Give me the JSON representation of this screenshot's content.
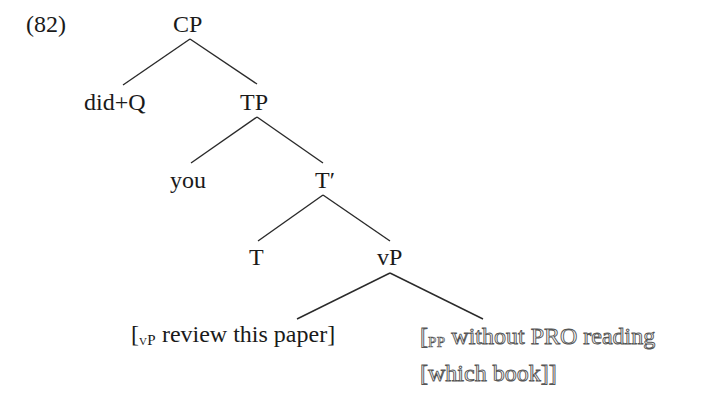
{
  "example_number": "(82)",
  "tree": {
    "nodes": {
      "cp": "CP",
      "did_q": "did+Q",
      "tp": "TP",
      "you": "you",
      "t_bar": "T′",
      "t": "T",
      "vp": "vP"
    },
    "leaves": {
      "vp_bracket": {
        "open": "[",
        "subscript": "vP",
        "text": " review this paper]"
      },
      "pp_bracket": {
        "open": "[",
        "subscript": "PP",
        "line1_text": " without PRO reading",
        "line2_text": "[which book]]"
      }
    },
    "edges": [
      {
        "from": "CP",
        "to": "did+Q"
      },
      {
        "from": "CP",
        "to": "TP"
      },
      {
        "from": "TP",
        "to": "you"
      },
      {
        "from": "TP",
        "to": "T′"
      },
      {
        "from": "T′",
        "to": "T"
      },
      {
        "from": "T′",
        "to": "vP"
      },
      {
        "from": "vP",
        "to": "[vP review this paper]"
      },
      {
        "from": "vP",
        "to": "[PP without PRO reading [which book]]"
      }
    ]
  },
  "colors": {
    "line": "#2a2a2a",
    "text": "#1a1a1a",
    "outline_stroke": "#555555"
  }
}
